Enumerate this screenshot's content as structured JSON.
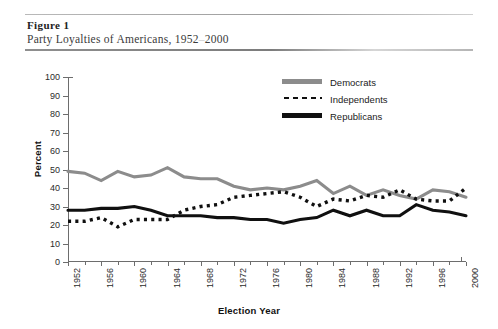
{
  "figure": {
    "label": "Figure 1",
    "title_prefix": "Party Loyalties of Americans, 1952",
    "title_dash": "–",
    "title_suffix": "2000"
  },
  "legend": {
    "position": "top-right",
    "items": [
      {
        "label": "Democrats",
        "style": "solid",
        "color": "#8c8c8c",
        "swatch": "sw-solid-gray"
      },
      {
        "label": "Independents",
        "style": "dotted",
        "color": "#101010",
        "swatch": "sw-dotted"
      },
      {
        "label": "Republicans",
        "style": "solid",
        "color": "#101010",
        "swatch": "sw-solid-black"
      }
    ]
  },
  "axes": {
    "ylabel": "Percent",
    "xlabel": "Election Year",
    "yticks": [
      0,
      10,
      20,
      30,
      40,
      50,
      60,
      70,
      80,
      90,
      100
    ],
    "xticks_major": [
      1952,
      1956,
      1960,
      1964,
      1968,
      1972,
      1976,
      1980,
      1984,
      1988,
      1992,
      1996,
      2000
    ],
    "xticks_minor": [
      1954,
      1958,
      1962,
      1966,
      1970,
      1974,
      1978,
      1982,
      1986,
      1990,
      1994,
      1998
    ]
  },
  "chart_data": {
    "type": "line",
    "title": "Party Loyalties of Americans, 1952–2000",
    "xlabel": "Election Year",
    "ylabel": "Percent",
    "xlim": [
      1952,
      2000
    ],
    "ylim": [
      0,
      100
    ],
    "grid": false,
    "legend_position": "top-right",
    "x": [
      1952,
      1954,
      1956,
      1958,
      1960,
      1962,
      1964,
      1966,
      1968,
      1970,
      1972,
      1974,
      1976,
      1978,
      1980,
      1982,
      1984,
      1986,
      1988,
      1990,
      1992,
      1994,
      1996,
      1998,
      2000
    ],
    "series": [
      {
        "name": "Democrats",
        "color": "#8c8c8c",
        "style": "solid",
        "values": [
          49,
          48,
          44,
          49,
          46,
          47,
          51,
          46,
          45,
          45,
          41,
          39,
          40,
          39,
          41,
          44,
          37,
          41,
          36,
          39,
          36,
          34,
          39,
          38,
          35
        ]
      },
      {
        "name": "Independents",
        "color": "#101010",
        "style": "dotted",
        "values": [
          22,
          22,
          24,
          19,
          23,
          23,
          23,
          28,
          30,
          31,
          35,
          36,
          37,
          38,
          35,
          30,
          34,
          33,
          36,
          35,
          39,
          34,
          33,
          33,
          40
        ]
      },
      {
        "name": "Republicans",
        "color": "#101010",
        "style": "solid",
        "values": [
          28,
          28,
          29,
          29,
          30,
          28,
          25,
          25,
          25,
          24,
          24,
          23,
          23,
          21,
          23,
          24,
          28,
          25,
          28,
          25,
          25,
          31,
          28,
          27,
          25
        ]
      }
    ]
  }
}
